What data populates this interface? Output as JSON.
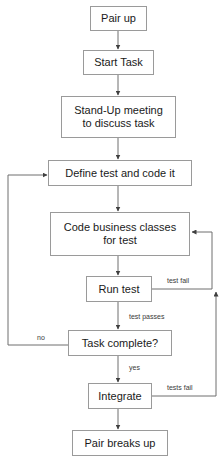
{
  "diagram": {
    "type": "flowchart",
    "colors": {
      "background": "#ffffff",
      "box_fill": "#ffffff",
      "box_border": "#9a9a9a",
      "text": "#1a1a1a",
      "line": "#6e6e6e",
      "label_text": "#3a3a3a"
    },
    "nodes": [
      {
        "id": "pair-up",
        "label": "Pair up",
        "x": 90,
        "y": 6,
        "w": 57,
        "h": 25
      },
      {
        "id": "start-task",
        "label": "Start Task",
        "x": 83,
        "y": 50,
        "w": 71,
        "h": 25
      },
      {
        "id": "stand-up-meeting",
        "label": "Stand-Up meeting\nto discuss task",
        "line1": "Stand-Up meeting",
        "line2": "to discuss task",
        "x": 61,
        "y": 96,
        "w": 115,
        "h": 42
      },
      {
        "id": "define-test",
        "label": "Define test and code it",
        "x": 48,
        "y": 160,
        "w": 144,
        "h": 26
      },
      {
        "id": "code-business-classes",
        "label": "Code business classes\nfor test",
        "line1": "Code business classes",
        "line2": "for test",
        "x": 50,
        "y": 212,
        "w": 140,
        "h": 44
      },
      {
        "id": "run-test",
        "label": "Run test",
        "x": 86,
        "y": 276,
        "w": 66,
        "h": 26
      },
      {
        "id": "task-complete",
        "label": "Task complete?",
        "x": 68,
        "y": 330,
        "w": 104,
        "h": 26
      },
      {
        "id": "integrate",
        "label": "Integrate",
        "x": 88,
        "y": 383,
        "w": 64,
        "h": 26
      },
      {
        "id": "pair-breaks-up",
        "label": "Pair breaks up",
        "x": 72,
        "y": 430,
        "w": 96,
        "h": 26
      }
    ],
    "edge_labels": [
      {
        "id": "test-fail",
        "text": "test fail",
        "x": 166,
        "y": 277
      },
      {
        "id": "test-passes",
        "text": "test passes",
        "x": 128,
        "y": 313
      },
      {
        "id": "no",
        "text": "no",
        "x": 36,
        "y": 334
      },
      {
        "id": "yes",
        "text": "yes",
        "x": 128,
        "y": 364
      },
      {
        "id": "tests-fail",
        "text": "tests fail",
        "x": 166,
        "y": 384
      }
    ]
  }
}
